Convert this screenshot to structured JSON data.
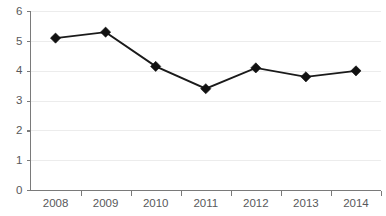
{
  "chart_data": {
    "type": "line",
    "title": "",
    "subtitle": "",
    "xlabel": "",
    "ylabel": "",
    "categories": [
      "2008",
      "2009",
      "2010",
      "2011",
      "2012",
      "2013",
      "2014"
    ],
    "values": [
      5.1,
      5.3,
      4.15,
      3.4,
      4.1,
      3.8,
      4.0
    ],
    "series": [
      {
        "name": "",
        "values": [
          5.1,
          5.3,
          4.15,
          3.4,
          4.1,
          3.8,
          4.0
        ]
      }
    ],
    "ylim": [
      0,
      6
    ],
    "yticks": [
      0,
      1,
      2,
      3,
      4,
      5,
      6
    ],
    "ytick_labels": [
      "0",
      "1",
      "2",
      "3",
      "4",
      "5",
      "6"
    ],
    "xtick_labels": [
      "2008",
      "2009",
      "2010",
      "2011",
      "2012",
      "2013",
      "2014"
    ],
    "grid": "horizontal",
    "legend": "none",
    "marker": "diamond",
    "colors": {
      "line": "#1a1a1a",
      "marker": "#111111",
      "gridline": "#ececec",
      "axis": "#7a7a7a",
      "tick_label": "#58595b",
      "background": "#ffffff"
    }
  }
}
